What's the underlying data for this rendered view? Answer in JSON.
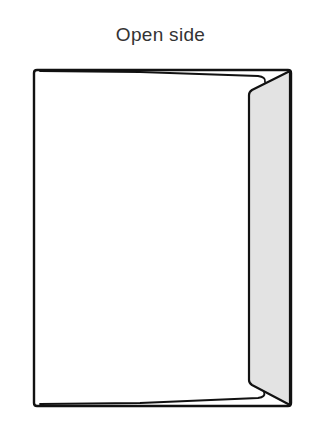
{
  "diagram": {
    "title": "Open side",
    "colors": {
      "stroke": "#111111",
      "paper": "#ffffff",
      "flap_fill": "#e3e3e3",
      "title_text": "#333333"
    }
  }
}
